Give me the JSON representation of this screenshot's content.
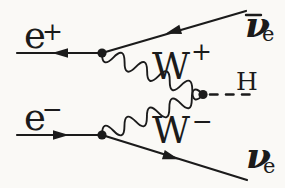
{
  "figure": {
    "kind": "feynman-diagram"
  },
  "colors": {
    "ink": "#1b1b1b",
    "paper": "#faf9f6"
  },
  "particles": {
    "positron": {
      "symbol": "e",
      "charge": "+"
    },
    "electron": {
      "symbol": "e",
      "charge": "−"
    },
    "anti_electron_neutrino": {
      "symbol": "ν",
      "subscript": "e"
    },
    "electron_neutrino": {
      "symbol": "ν",
      "subscript": "e"
    },
    "w_plus": {
      "symbol": "W",
      "charge": "+"
    },
    "w_minus": {
      "symbol": "W",
      "charge": "−"
    },
    "higgs": {
      "symbol": "H"
    }
  }
}
